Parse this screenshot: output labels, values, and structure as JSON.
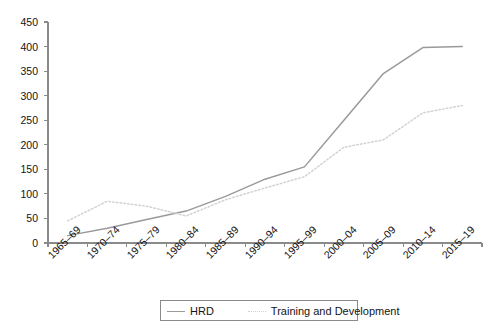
{
  "chart_data": {
    "type": "line",
    "title": "",
    "xlabel": "",
    "ylabel": "",
    "ylim": [
      0,
      450
    ],
    "ytick_step": 50,
    "grid": false,
    "legend_position": "bottom",
    "categories": [
      "1965–69",
      "1970–74",
      "1975–79",
      "1980–84",
      "1985–89",
      "1990–94",
      "1995–99",
      "2000–04",
      "2005–09",
      "2010–14",
      "2015–19"
    ],
    "yticks": [
      "0",
      "50",
      "100",
      "150",
      "200",
      "250",
      "300",
      "350",
      "400",
      "450"
    ],
    "ytick_values": [
      0,
      50,
      100,
      150,
      200,
      250,
      300,
      350,
      400,
      450
    ],
    "series": [
      {
        "name": "HRD",
        "style": "solid",
        "color": "#9a9a9a",
        "values": [
          15,
          30,
          48,
          65,
          95,
          130,
          155,
          250,
          345,
          398,
          400
        ]
      },
      {
        "name": "Training and Development",
        "style": "dotted",
        "color": "#d2d2d2",
        "values": [
          45,
          85,
          75,
          55,
          88,
          112,
          135,
          195,
          210,
          265,
          280
        ]
      }
    ]
  },
  "legend": {
    "entries": [
      {
        "label": "HRD"
      },
      {
        "label": "Training and Development"
      }
    ]
  },
  "colors": {
    "axis": "#8a8a8a",
    "text": "#141414",
    "series_hrd": "#9a9a9a",
    "series_td": "#d2d2d2",
    "background": "#ffffff"
  }
}
